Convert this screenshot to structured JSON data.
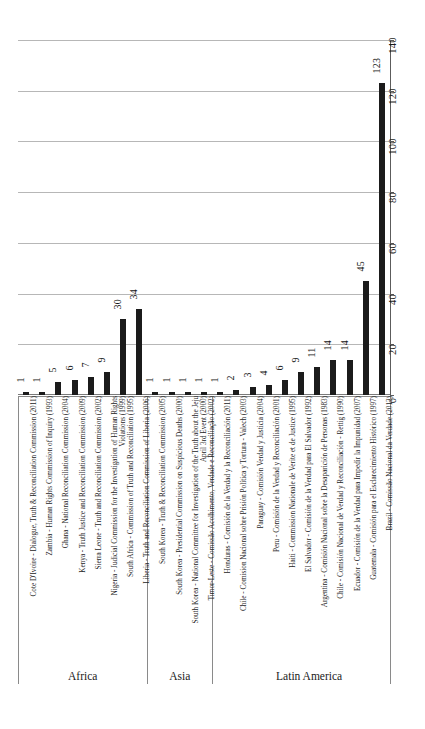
{
  "chart_data": {
    "type": "bar",
    "title": "",
    "xlabel": "",
    "ylabel": "",
    "orientation": "vertical",
    "grid": true,
    "legend": "none",
    "ylim": [
      0,
      140
    ],
    "yticks": [
      "0",
      "20",
      "40",
      "60",
      "80",
      "100",
      "120",
      "140"
    ],
    "tick_values": [
      0,
      20,
      40,
      60,
      80,
      100,
      120,
      140
    ],
    "groups": [
      {
        "name": "Africa",
        "start": 0,
        "count": 8
      },
      {
        "name": "Asia",
        "start": 8,
        "count": 4
      },
      {
        "name": "Latin America",
        "start": 12,
        "count": 12
      }
    ],
    "categories": [
      "Cote D'Ivoire - Dialogue, Truth & Reconciliation Commission (2011)",
      "Zambia - Human Rights Commission of Inquiry (1993)",
      "Ghana - National Reconciliation Commission (2004)",
      "Kenya - Truth Justice and Reconciliation Commission (2009)",
      "Sierra Leone - Truth and Reconciliation Commission (2002)",
      "Nigeria - Judicial Commission for the Investigation of Human Rights Violations (1999)",
      "South Africa - Commission of Truth and Reconciliation (1995)",
      "Liberia - Truth and Reconciliation Commission of Liberia (2006)",
      "South Korea - Truth & Reconciliation Commission (2005)",
      "South Korea - Presidential Commission on Suspicious Deaths (2000)",
      "South Korea - National Committee for Investigation of the Truth about the Jeju April 3rd Event (2000)",
      "Timor-Leste - Comissão Acolhimento, Verdade e Reconciliação (2002)",
      "Honduras - Comisión de la Verdad y la Reconciliación (2011)",
      "Chile - Comision Nacional sobre Prisión Política y Tortura - Valech (2003)",
      "Paraguay - Comisión Verdad y Justicia (2004)",
      "Peru - Comisión de la Verdad y Reconciliación (2001)",
      "Haiti - Commission Nationale de Verite et de Justice (1995)",
      "El Salvador - Comisión de la Verdad para El Salvador (1992)",
      "Argentina - Comisión Nacional sobre la Desaparición de Personas (1983)",
      "Chile - Comisión Nacional de Verdad y Reconciliación - Rettig (1990)",
      "Ecuador - Comisión de la Verdad para Impedir la Impunidad (2007)",
      "Guatemala - Comisión para el Esclarecimiento Histórico (1997)",
      "Brazil - Comissão Nacional da Verdade (2012)"
    ],
    "values": [
      1,
      1,
      5,
      6,
      7,
      9,
      30,
      34,
      1,
      1,
      1,
      1,
      1,
      2,
      3,
      4,
      6,
      9,
      11,
      14,
      14,
      45,
      123
    ],
    "value_labels": [
      "1",
      "1",
      "5",
      "6",
      "7",
      "9",
      "30",
      "34",
      "1",
      "1",
      "1",
      "1",
      "1",
      "2",
      "3",
      "4",
      "6",
      "9",
      "11",
      "14",
      "14",
      "45",
      "123"
    ],
    "bar_color": "#1b1b1b",
    "gridline_color": "#b7b7b7",
    "axis_color": "#5c5c5c"
  }
}
